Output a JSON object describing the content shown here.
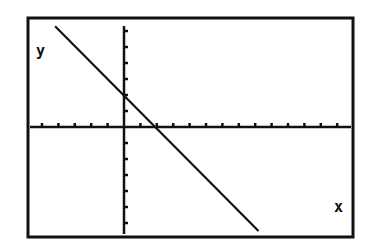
{
  "chart_data": {
    "type": "line",
    "title": "",
    "xlabel": "x",
    "ylabel": "y",
    "xlim": [
      -5.8,
      13.9
    ],
    "ylim": [
      -6.6,
      6.8
    ],
    "grid": false,
    "x_ticks": [
      -5,
      -4,
      -3,
      -2,
      -1,
      1,
      2,
      3,
      4,
      5,
      6,
      7,
      8,
      9,
      10,
      11,
      12,
      13
    ],
    "y_ticks": [
      -6,
      -5,
      -4,
      -3,
      -2,
      -1,
      1,
      2,
      3,
      4,
      5,
      6
    ],
    "series": [
      {
        "name": "y = -x + 2",
        "x": [
          -4.2,
          8.2
        ],
        "y": [
          6.3,
          -6.5
        ],
        "slope": -1,
        "intercept": 2
      }
    ],
    "legend": null
  },
  "labels": {
    "x_axis": "x",
    "y_axis": "y"
  },
  "colors": {
    "ink": "#111111",
    "background": "#ffffff"
  }
}
